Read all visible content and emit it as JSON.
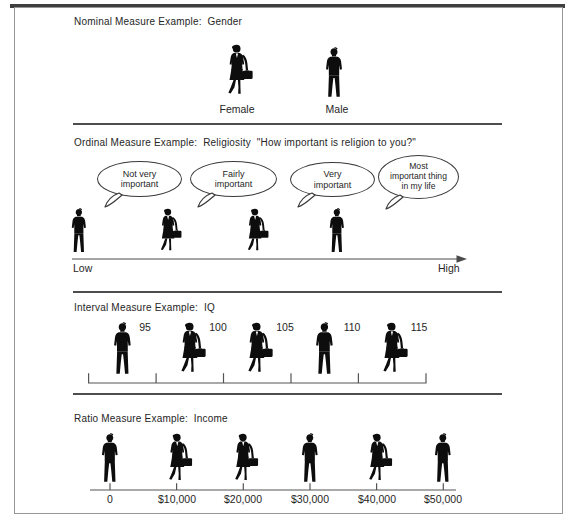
{
  "figure": {
    "nominal": {
      "title": "Nominal Measure Example:  Gender",
      "female_label": "Female",
      "male_label": "Male"
    },
    "ordinal": {
      "title": "Ordinal Measure Example:  Religiosity  \"How important is religion to you?\"",
      "bubbles": [
        {
          "lines": [
            "Not very",
            "important"
          ]
        },
        {
          "lines": [
            "Fairly",
            "important"
          ]
        },
        {
          "lines": [
            "Very",
            "important"
          ]
        },
        {
          "lines": [
            "Most",
            "important thing",
            "in my life"
          ]
        }
      ],
      "axis_low": "Low",
      "axis_high": "High"
    },
    "interval": {
      "title": "Interval Measure Example:  IQ",
      "values": [
        "95",
        "100",
        "105",
        "110",
        "115"
      ]
    },
    "ratio": {
      "title": "Ratio Measure Example:  Income",
      "values": [
        "0",
        "$10,000",
        "$20,000",
        "$30,000",
        "$40,000",
        "$50,000"
      ]
    },
    "icons": {
      "male": "male-business-silhouette",
      "female": "female-business-silhouette-with-briefcase"
    },
    "colors": {
      "silhouette": "#0d0d0d",
      "rule": "#4d4d4d",
      "frame_border": "#979797",
      "top_bar": "#3f3f3f",
      "background": "#ffffff"
    }
  }
}
